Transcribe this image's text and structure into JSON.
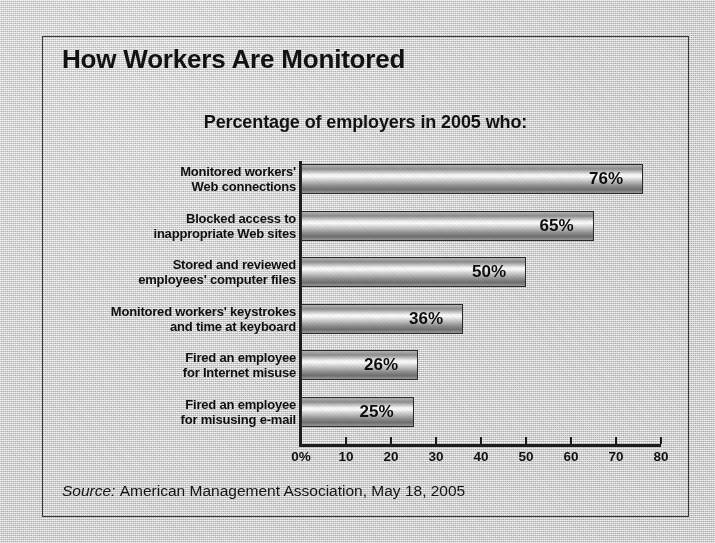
{
  "chart_data": {
    "type": "bar",
    "orientation": "horizontal",
    "title": "How Workers Are Monitored",
    "subtitle": "Percentage of employers in 2005 who:",
    "xlabel": "",
    "ylabel": "",
    "xlim": [
      0,
      80
    ],
    "grid": false,
    "legend": "none",
    "categories": [
      "Monitored workers' Web connections",
      "Blocked access to inappropriate Web sites",
      "Stored and reviewed employees' computer files",
      "Monitored workers' keystrokes and time at keyboard",
      "Fired an employee for Internet misuse",
      "Fired an employee for misusing e-mail"
    ],
    "category_lines": [
      [
        "Monitored workers'",
        "Web connections"
      ],
      [
        "Blocked access to",
        "inappropriate Web sites"
      ],
      [
        "Stored and reviewed",
        "employees' computer files"
      ],
      [
        "Monitored workers' keystrokes",
        "and time at keyboard"
      ],
      [
        "Fired an employee",
        "for Internet misuse"
      ],
      [
        "Fired an employee",
        "for misusing e-mail"
      ]
    ],
    "values": [
      76,
      65,
      50,
      36,
      26,
      25
    ],
    "data_labels": [
      "76%",
      "65%",
      "50%",
      "36%",
      "26%",
      "25%"
    ],
    "xticks": [
      0,
      10,
      20,
      30,
      40,
      50,
      60,
      70,
      80
    ],
    "xtick_labels": [
      "0%",
      "10",
      "20",
      "30",
      "40",
      "50",
      "60",
      "70",
      "80"
    ]
  },
  "source": {
    "prefix": "Source:",
    "text": "American Management Association, May 18, 2005"
  },
  "colors": {
    "paper": "#d4d4d4",
    "ink": "#121212",
    "frame": "#3a3a3a",
    "bar_light": "#fafafa",
    "bar_dark": "#6f6f6f"
  }
}
